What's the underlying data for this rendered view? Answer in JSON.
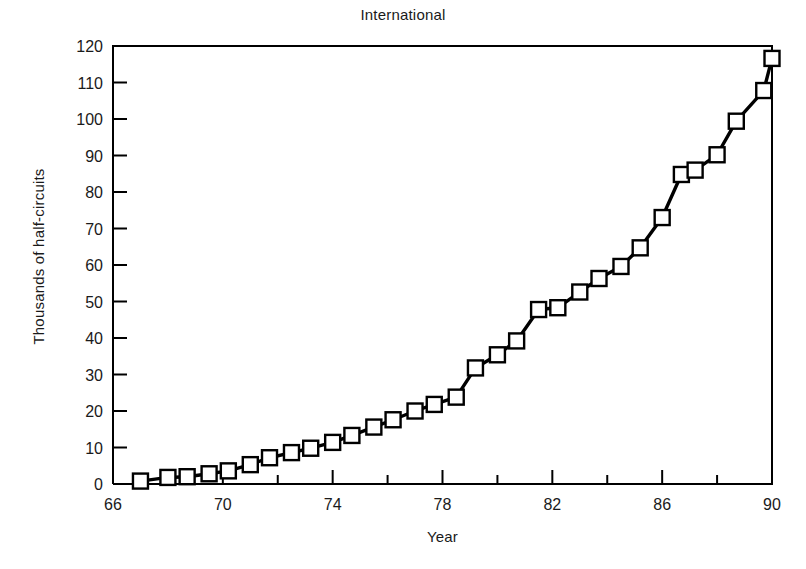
{
  "chart_data": {
    "type": "line",
    "title": "International",
    "xlabel": "Year",
    "ylabel": "Thousands of half-circuits",
    "xlim": [
      66,
      90
    ],
    "ylim": [
      0,
      120
    ],
    "grid": false,
    "legend": null,
    "marker": "open-square",
    "line_color": "#000000",
    "marker_fill": "#ffffff",
    "xticks_major": [
      66,
      70,
      74,
      78,
      82,
      86,
      90
    ],
    "xticks_major_labels": [
      "66",
      "70",
      "74",
      "78",
      "82",
      "86",
      "90"
    ],
    "xticks_minor": [
      68,
      72,
      76,
      80,
      84,
      88
    ],
    "yticks": [
      0,
      10,
      20,
      30,
      40,
      50,
      60,
      70,
      80,
      90,
      100,
      110,
      120
    ],
    "ytick_labels": [
      "0",
      "10",
      "20",
      "30",
      "40",
      "50",
      "60",
      "70",
      "80",
      "90",
      "100",
      "110",
      "120"
    ],
    "x": [
      67.0,
      68.0,
      68.7,
      69.5,
      70.2,
      71.0,
      71.7,
      72.5,
      73.2,
      74.0,
      74.7,
      75.5,
      76.2,
      77.0,
      77.7,
      78.5,
      79.2,
      80.0,
      80.7,
      81.5,
      82.2,
      83.0,
      83.7,
      84.5,
      85.2,
      86.0,
      86.7,
      87.2,
      88.0,
      88.7,
      89.7
    ],
    "y": [
      0.8,
      1.8,
      2.0,
      2.8,
      3.6,
      5.3,
      7.2,
      8.6,
      9.8,
      11.4,
      13.3,
      15.6,
      17.6,
      20.0,
      21.8,
      23.8,
      31.8,
      35.4,
      39.2,
      47.8,
      48.3,
      52.6,
      56.3,
      59.6,
      64.7,
      73.0,
      84.8,
      86.0,
      90.2,
      99.4,
      107.8
    ],
    "final_point": {
      "x": 90.0,
      "y": 116.6
    }
  }
}
